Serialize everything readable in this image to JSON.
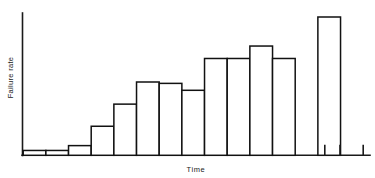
{
  "chart_data": {
    "type": "bar",
    "title": "",
    "subtitle": "",
    "xlabel": "Time",
    "ylabel": "Failure rate",
    "grid": false,
    "legend": null,
    "legend_position": "none",
    "xlim": [
      0,
      15
    ],
    "ylim": [
      0,
      1
    ],
    "categories": [
      "1",
      "2",
      "3",
      "4",
      "5",
      "6",
      "7",
      "8",
      "9",
      "10",
      "11",
      "12",
      "13",
      "14",
      "15"
    ],
    "values": [
      0.035,
      0.035,
      0.07,
      0.21,
      0.37,
      0.53,
      0.52,
      0.47,
      0.7,
      0.7,
      0.79,
      0.7,
      0.0,
      1.0,
      0.0
    ],
    "bars": [
      {
        "index": 1,
        "value": 0.035,
        "visible": true
      },
      {
        "index": 2,
        "value": 0.035,
        "visible": true
      },
      {
        "index": 3,
        "value": 0.07,
        "visible": true
      },
      {
        "index": 4,
        "value": 0.21,
        "visible": true
      },
      {
        "index": 5,
        "value": 0.37,
        "visible": true
      },
      {
        "index": 6,
        "value": 0.53,
        "visible": true
      },
      {
        "index": 7,
        "value": 0.52,
        "visible": true
      },
      {
        "index": 8,
        "value": 0.47,
        "visible": true
      },
      {
        "index": 9,
        "value": 0.7,
        "visible": true
      },
      {
        "index": 10,
        "value": 0.7,
        "visible": true
      },
      {
        "index": 11,
        "value": 0.79,
        "visible": true
      },
      {
        "index": 12,
        "value": 0.7,
        "visible": true
      },
      {
        "index": 13,
        "value": 0.0,
        "visible": false
      },
      {
        "index": 14,
        "value": 1.0,
        "visible": true
      },
      {
        "index": 15,
        "value": 0.0,
        "visible": false
      }
    ],
    "axis_color": "#1a1a1a",
    "bar_stroke_color": "#111111",
    "bar_fill_color": "#ffffff",
    "background_color": "#ffffff"
  }
}
